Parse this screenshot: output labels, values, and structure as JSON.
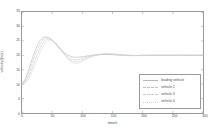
{
  "chart_data": {
    "type": "line",
    "title": "",
    "xlabel": "time/s",
    "ylabel": "velocity/(m/s)",
    "xlim": [
      0,
      300
    ],
    "ylim": [
      0,
      35
    ],
    "xticks": [
      0,
      50,
      100,
      150,
      200,
      250,
      300
    ],
    "yticks": [
      0,
      5,
      10,
      15,
      20,
      25,
      30,
      35
    ],
    "xtick_labels": [
      "0",
      "50",
      "100",
      "150",
      "200",
      "250",
      "300"
    ],
    "ytick_labels": [
      "0",
      "5",
      "10",
      "15",
      "20",
      "25",
      "30",
      "35"
    ],
    "grid": false,
    "legend_position": "lower right",
    "series": [
      {
        "name": "leading vehicle",
        "color": "#b9b9b9",
        "dash": "none",
        "x": [
          0,
          5,
          10,
          15,
          20,
          25,
          30,
          35,
          40,
          45,
          50,
          55,
          60,
          65,
          70,
          75,
          80,
          85,
          90,
          95,
          100,
          110,
          120,
          130,
          140,
          150,
          160,
          170,
          180,
          190,
          200,
          220,
          240,
          260,
          280,
          300
        ],
        "values": [
          10.0,
          11.6,
          14.2,
          17.4,
          20.6,
          23.3,
          25.2,
          26.2,
          26.4,
          26.0,
          25.2,
          24.1,
          22.9,
          21.8,
          20.9,
          20.2,
          19.7,
          19.4,
          19.3,
          19.4,
          19.5,
          19.8,
          20.1,
          20.3,
          20.3,
          20.2,
          20.1,
          20.0,
          19.9,
          19.9,
          20.0,
          20.0,
          20.0,
          20.0,
          20.0,
          20.0
        ]
      },
      {
        "name": "vehicle 2",
        "color": "#c4c4c4",
        "dash": "dashed",
        "x": [
          0,
          5,
          10,
          15,
          20,
          25,
          30,
          35,
          40,
          45,
          50,
          55,
          60,
          65,
          70,
          75,
          80,
          85,
          90,
          95,
          100,
          110,
          120,
          130,
          140,
          150,
          160,
          170,
          180,
          190,
          200,
          220,
          240,
          260,
          280,
          300
        ],
        "values": [
          10.0,
          11.0,
          13.0,
          15.8,
          18.9,
          21.8,
          24.0,
          25.4,
          26.0,
          25.9,
          25.3,
          24.3,
          23.1,
          21.8,
          20.6,
          19.6,
          18.9,
          18.5,
          18.4,
          18.6,
          18.9,
          19.5,
          20.0,
          20.3,
          20.4,
          20.3,
          20.1,
          20.0,
          19.9,
          19.9,
          20.0,
          20.0,
          20.0,
          20.0,
          20.0,
          20.0
        ]
      },
      {
        "name": "vehicle 3",
        "color": "#cccccc",
        "dash": "dashdot",
        "x": [
          0,
          5,
          10,
          15,
          20,
          25,
          30,
          35,
          40,
          45,
          50,
          55,
          60,
          65,
          70,
          75,
          80,
          85,
          90,
          95,
          100,
          110,
          120,
          130,
          140,
          150,
          160,
          170,
          180,
          190,
          200,
          220,
          240,
          260,
          280,
          300
        ],
        "values": [
          10.0,
          10.6,
          12.1,
          14.4,
          17.2,
          20.1,
          22.6,
          24.4,
          25.4,
          25.6,
          25.2,
          24.3,
          23.1,
          21.7,
          20.3,
          19.1,
          18.3,
          17.8,
          17.7,
          17.9,
          18.3,
          19.2,
          19.9,
          20.3,
          20.5,
          20.4,
          20.2,
          20.1,
          20.0,
          19.9,
          19.9,
          20.0,
          20.0,
          20.0,
          20.0,
          20.0
        ]
      },
      {
        "name": "vehicle 4",
        "color": "#d4d4d4",
        "dash": "dotted",
        "x": [
          0,
          5,
          10,
          15,
          20,
          25,
          30,
          35,
          40,
          45,
          50,
          55,
          60,
          65,
          70,
          75,
          80,
          85,
          90,
          95,
          100,
          110,
          120,
          130,
          140,
          150,
          160,
          170,
          180,
          190,
          200,
          220,
          240,
          260,
          280,
          300
        ],
        "values": [
          10.0,
          10.3,
          11.4,
          13.2,
          15.7,
          18.4,
          21.0,
          23.1,
          24.6,
          25.2,
          25.1,
          24.4,
          23.3,
          21.9,
          20.3,
          18.9,
          17.9,
          17.3,
          17.1,
          17.4,
          17.9,
          19.0,
          19.8,
          20.4,
          20.6,
          20.6,
          20.3,
          20.1,
          20.0,
          19.9,
          19.9,
          20.0,
          20.0,
          20.0,
          20.0,
          20.0
        ]
      }
    ]
  },
  "legend": {
    "items": [
      {
        "label": "leading vehicle"
      },
      {
        "label": "vehicle 2"
      },
      {
        "label": "vehicle 3"
      },
      {
        "label": "vehicle 4"
      }
    ]
  }
}
